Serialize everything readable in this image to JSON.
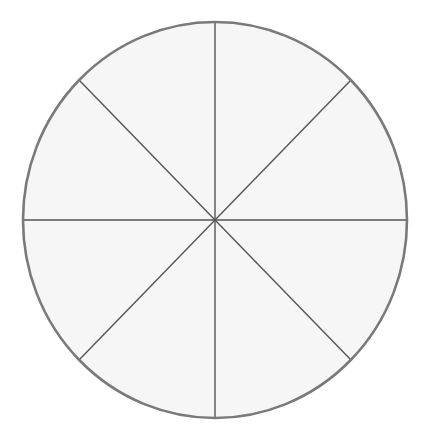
{
  "diagram": {
    "type": "divided-circle",
    "segments": 8,
    "center": [
      215,
      220
    ],
    "radius_x": 192,
    "radius_y": 198,
    "colors": {
      "fill": "#f6f6f6",
      "outline": "#7a7a7a",
      "divider": "#555555",
      "background": "#ffffff"
    },
    "dividers": [
      {
        "angle_deg": 0
      },
      {
        "angle_deg": 45
      },
      {
        "angle_deg": 90
      },
      {
        "angle_deg": 135
      }
    ]
  }
}
